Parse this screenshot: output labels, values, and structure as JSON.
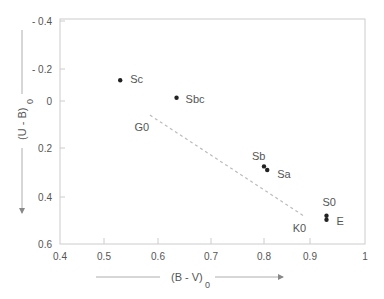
{
  "chart_data": {
    "type": "scatter",
    "title": "",
    "xlabel": "(B - V)",
    "xlabel_subscript": "0",
    "ylabel": "(U - B)",
    "ylabel_subscript": "0",
    "xlim": [
      0.4,
      1.0
    ],
    "ylim": [
      -0.4,
      0.6
    ],
    "y_inverted": true,
    "grid": false,
    "x_ticks": [
      {
        "value": 0.4,
        "label": "0.4"
      },
      {
        "value": 0.5,
        "label": "0.5"
      },
      {
        "value": 0.6,
        "label": "0.6"
      },
      {
        "value": 0.7,
        "label": "0.7"
      },
      {
        "value": 0.8,
        "label": "0.8"
      },
      {
        "value": 0.9,
        "label": "0.9"
      },
      {
        "value": 1.0,
        "label": "1"
      }
    ],
    "y_ticks": [
      {
        "value": -0.4,
        "label": "- 0.4"
      },
      {
        "value": -0.2,
        "label": "- 0.2"
      },
      {
        "value": 0.0,
        "label": "0"
      },
      {
        "value": 0.2,
        "label": "0.2"
      },
      {
        "value": 0.4,
        "label": "0.4"
      },
      {
        "value": 0.6,
        "label": "0.6"
      }
    ],
    "points": [
      {
        "label": "Sc",
        "x": 0.53,
        "y": -0.13,
        "label_dx": 10,
        "label_dy": 3
      },
      {
        "label": "Sbc",
        "x": 0.635,
        "y": -0.02,
        "label_dx": 9,
        "label_dy": 5
      },
      {
        "label": "Sb",
        "x": 0.8,
        "y": 0.275,
        "label_dx": -12,
        "label_dy": -6
      },
      {
        "label": "Sa",
        "x": 0.807,
        "y": 0.29,
        "label_dx": 10,
        "label_dy": 8
      },
      {
        "label": "S0",
        "x": 0.93,
        "y": 0.48,
        "label_dx": -4,
        "label_dy": -10
      },
      {
        "label": "E",
        "x": 0.93,
        "y": 0.497,
        "label_dx": 10,
        "label_dy": 5
      }
    ],
    "line": {
      "style": "dashed",
      "from": {
        "label": "G0",
        "x": 0.585,
        "y": 0.06
      },
      "to": {
        "label": "K0",
        "x": 0.89,
        "y": 0.485
      }
    },
    "line_labels": [
      {
        "label": "G0",
        "x": 0.585,
        "y": 0.06,
        "dx": -8,
        "dy": 16
      },
      {
        "label": "K0",
        "x": 0.89,
        "y": 0.485,
        "dx": -6,
        "dy": 15
      }
    ]
  }
}
